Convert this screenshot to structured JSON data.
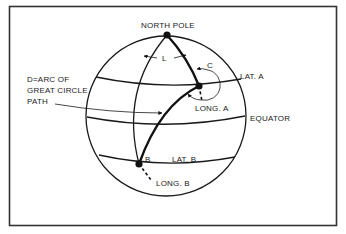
{
  "diagram": {
    "type": "great-circle-navigation",
    "labels": {
      "north_pole": "NORTH POLE",
      "angle_l": "L",
      "angle_c": "C",
      "lat_a": "LAT. A",
      "long_a": "LONG. A",
      "equator": "EQUATOR",
      "lat_b": "LAT. B",
      "long_b": "LONG. B",
      "point_b": "B",
      "d_line1": "D=ARC OF",
      "d_line2": "GREAT CIRCLE",
      "d_line3": "PATH"
    },
    "colors": {
      "ink": "#111111",
      "background": "#ffffff",
      "frame": "#333333"
    }
  }
}
